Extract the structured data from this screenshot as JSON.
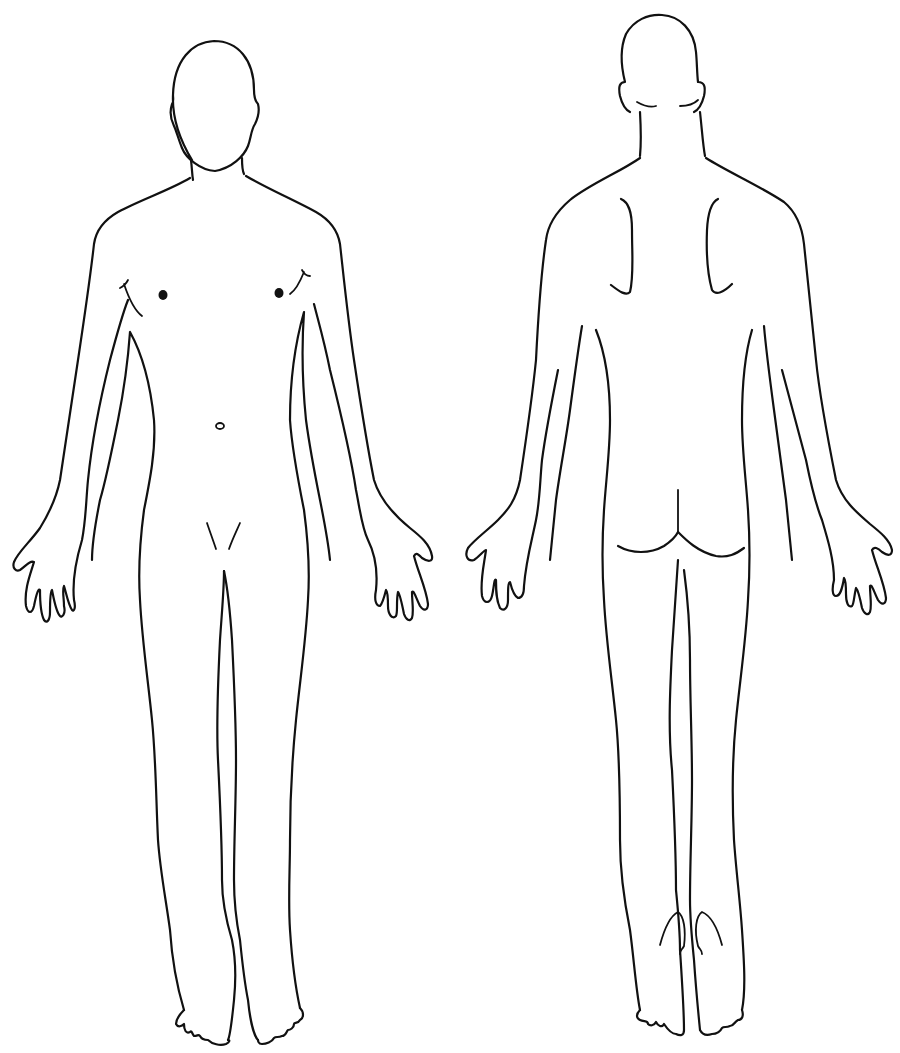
{
  "diagram": {
    "type": "body-outline-chart",
    "background": "#ffffff",
    "line_color": "#111111",
    "views": [
      {
        "id": "anterior",
        "label": "Front view (anterior)",
        "position": "left"
      },
      {
        "id": "posterior",
        "label": "Back view (posterior)",
        "position": "right"
      }
    ]
  }
}
